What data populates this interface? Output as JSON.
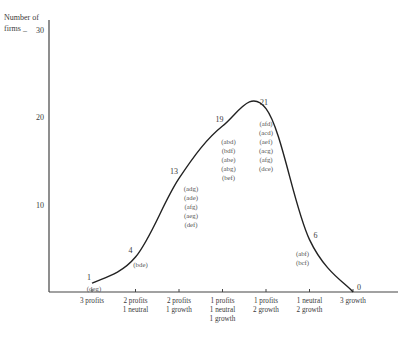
{
  "chart_data": {
    "type": "line",
    "title": "",
    "xlabel": "",
    "ylabel": "Number of firms",
    "ylim": [
      0,
      30
    ],
    "yticks": [
      10,
      20,
      30
    ],
    "grid": false,
    "legend": "none",
    "categories": [
      [
        "3 profits"
      ],
      [
        "2 profits",
        "1 neutral"
      ],
      [
        "2 profits",
        "1 growth"
      ],
      [
        "1 profits",
        "1 neutral",
        "1 growth"
      ],
      [
        "1 profits",
        "2 growth"
      ],
      [
        "1 neutral",
        "2 growth"
      ],
      [
        "3 growth"
      ]
    ],
    "values": [
      1,
      4,
      13,
      19,
      21,
      6,
      0
    ],
    "annotations": [
      [
        "(deg)"
      ],
      [
        "(bde)"
      ],
      [
        "(adg)",
        "(ade)",
        "(afg)",
        "(aeg)",
        "(def)"
      ],
      [
        "(abd)",
        "(bdf)",
        "(abe)",
        "(abg)",
        "(bef)"
      ],
      [
        "(afd)",
        "(acd)",
        "(aef)",
        "(acg)",
        "(afg)",
        "(dce)"
      ],
      [
        "(abf)",
        "(bcf)"
      ],
      []
    ],
    "ylabel_lines": [
      "Number of",
      "firms _"
    ]
  }
}
